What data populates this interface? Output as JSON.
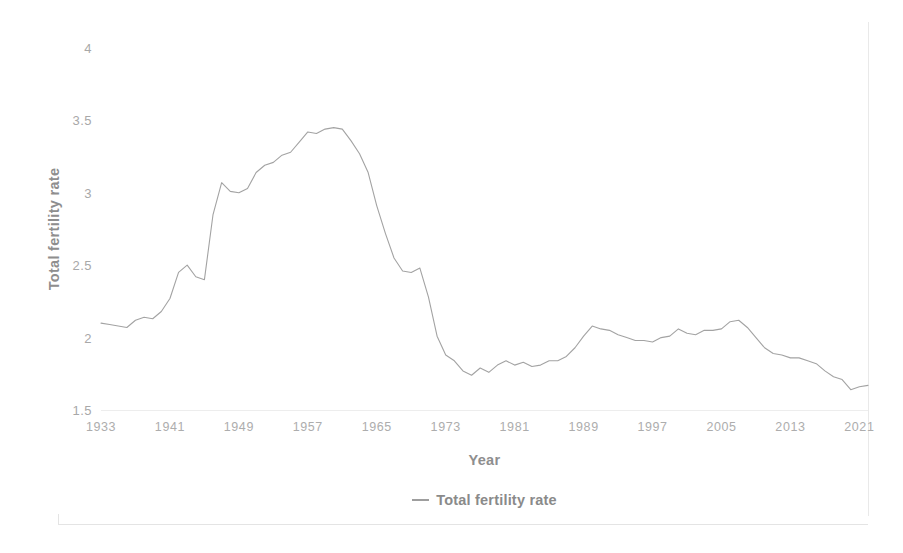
{
  "chart_data": {
    "type": "line",
    "title": "",
    "xlabel": "Year",
    "ylabel": "Total fertility rate",
    "xlim": [
      1933,
      2022
    ],
    "ylim": [
      1.5,
      4
    ],
    "grid": false,
    "legend_position": "bottom-center",
    "legend": [
      "Total fertility rate"
    ],
    "y_ticks": [
      "4",
      "3.5",
      "3",
      "2.5",
      "2",
      "1.5"
    ],
    "y_tick_values": [
      4,
      3.5,
      3,
      2.5,
      2,
      1.5
    ],
    "x_ticks": [
      "1933",
      "1941",
      "1949",
      "1957",
      "1965",
      "1973",
      "1981",
      "1989",
      "1997",
      "2005",
      "2013",
      "2021"
    ],
    "x_tick_values": [
      1933,
      1941,
      1949,
      1957,
      1965,
      1973,
      1981,
      1989,
      1997,
      2005,
      2013,
      2021
    ],
    "line_color": "#a3a3a3",
    "series": [
      {
        "name": "Total fertility rate",
        "x": [
          1933,
          1934,
          1935,
          1936,
          1937,
          1938,
          1939,
          1940,
          1941,
          1942,
          1943,
          1944,
          1945,
          1946,
          1947,
          1948,
          1949,
          1950,
          1951,
          1952,
          1953,
          1954,
          1955,
          1956,
          1957,
          1958,
          1959,
          1960,
          1961,
          1962,
          1963,
          1964,
          1965,
          1966,
          1967,
          1968,
          1969,
          1970,
          1971,
          1972,
          1973,
          1974,
          1975,
          1976,
          1977,
          1978,
          1979,
          1980,
          1981,
          1982,
          1983,
          1984,
          1985,
          1986,
          1987,
          1988,
          1989,
          1990,
          1991,
          1992,
          1993,
          1994,
          1995,
          1996,
          1997,
          1998,
          1999,
          2000,
          2001,
          2002,
          2003,
          2004,
          2005,
          2006,
          2007,
          2008,
          2009,
          2010,
          2011,
          2012,
          2013,
          2014,
          2015,
          2016,
          2017,
          2018,
          2019,
          2020,
          2021,
          2022
        ],
        "values": [
          2.1,
          2.09,
          2.08,
          2.07,
          2.12,
          2.14,
          2.13,
          2.18,
          2.27,
          2.45,
          2.5,
          2.42,
          2.4,
          2.85,
          3.07,
          3.01,
          3.0,
          3.03,
          3.14,
          3.19,
          3.21,
          3.26,
          3.28,
          3.35,
          3.42,
          3.41,
          3.44,
          3.45,
          3.44,
          3.36,
          3.27,
          3.14,
          2.91,
          2.72,
          2.55,
          2.46,
          2.45,
          2.48,
          2.28,
          2.01,
          1.88,
          1.84,
          1.77,
          1.74,
          1.79,
          1.76,
          1.81,
          1.84,
          1.81,
          1.83,
          1.8,
          1.81,
          1.84,
          1.84,
          1.87,
          1.93,
          2.01,
          2.08,
          2.06,
          2.05,
          2.02,
          2.0,
          1.98,
          1.98,
          1.97,
          2.0,
          2.01,
          2.06,
          2.03,
          2.02,
          2.05,
          2.05,
          2.06,
          2.11,
          2.12,
          2.07,
          2.0,
          1.93,
          1.89,
          1.88,
          1.86,
          1.86,
          1.84,
          1.82,
          1.77,
          1.73,
          1.71,
          1.64,
          1.66,
          1.67
        ]
      }
    ],
    "note_scaled_series": {
      "description": "Pixel-derived rendering polyline (normalized to axes)",
      "use": "render"
    }
  },
  "axis": {
    "y_title": "Total fertility rate",
    "x_title": "Year"
  },
  "legend": {
    "items": [
      {
        "label": "Total fertility rate"
      }
    ]
  }
}
